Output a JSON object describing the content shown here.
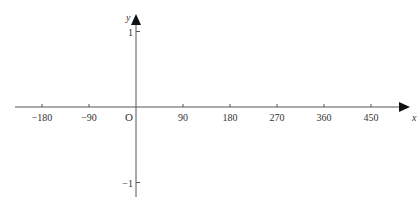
{
  "chart_data": {
    "type": "line",
    "title": "",
    "xlabel": "x",
    "ylabel": "y",
    "origin_label": "O",
    "x_ticks": [
      -180,
      -90,
      90,
      180,
      270,
      360,
      450
    ],
    "x_tick_labels": [
      "−180",
      "−90",
      "90",
      "180",
      "270",
      "360",
      "450"
    ],
    "y_ticks": [
      1,
      -1
    ],
    "y_tick_labels": [
      "1",
      "−1"
    ],
    "xlim": [
      -230,
      510
    ],
    "ylim": [
      -1.2,
      1.3
    ],
    "grid": false,
    "series": []
  },
  "colors": {
    "axis": "#555555",
    "text": "#333333"
  }
}
